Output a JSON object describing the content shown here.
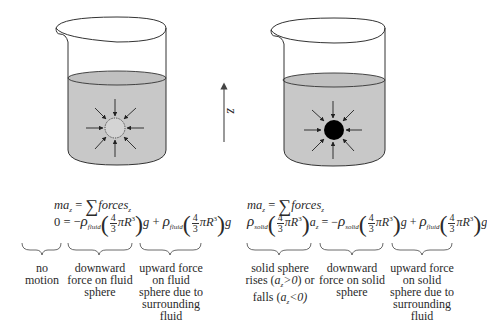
{
  "diagram": {
    "axis": {
      "label": "z",
      "direction": "up"
    },
    "colors": {
      "fluid": "#c8c8c8",
      "outline": "#333333",
      "solid_sphere": "#000000",
      "background": "#ffffff"
    },
    "left_beaker": {
      "sphere": "fluid sphere (dotted outline)",
      "equation_line1": {
        "lhs": "ma",
        "lhs_sub": "z",
        "eq": "=",
        "sum": "∑",
        "rhs": "forces",
        "rhs_sub": "z"
      },
      "equation_line2": {
        "lhs": "0",
        "term1_sign": "= −",
        "term1_rho": "ρ",
        "term1_rho_sub": "fluid",
        "frac_num": "4",
        "frac_den": "3",
        "piR": "πR",
        "exp": "3",
        "g": "g",
        "term2_sign": "+",
        "term2_rho": "ρ",
        "term2_rho_sub": "fluid"
      },
      "annotations": [
        {
          "text_lines": [
            "no",
            "motion"
          ]
        },
        {
          "text_lines": [
            "downward",
            "force on fluid",
            "sphere"
          ]
        },
        {
          "text_lines": [
            "upward force",
            "on fluid",
            "sphere due to",
            "surrounding",
            "fluid"
          ]
        }
      ]
    },
    "right_beaker": {
      "sphere": "solid sphere (filled black)",
      "equation_line1": {
        "lhs": "ma",
        "lhs_sub": "z",
        "eq": "=",
        "sum": "∑",
        "rhs": "forces",
        "rhs_sub": "z"
      },
      "equation_line2": {
        "lhs_rho": "ρ",
        "lhs_rho_sub": "solid",
        "frac_num": "4",
        "frac_den": "3",
        "piR": "πR",
        "exp": "3",
        "a": "a",
        "a_sub": "z",
        "term1_sign": "= −",
        "term1_rho": "ρ",
        "term1_rho_sub": "solid",
        "g": "g",
        "term2_sign": "+",
        "term2_rho": "ρ",
        "term2_rho_sub": "fluid"
      },
      "annotations": [
        {
          "text_lines": [
            "solid sphere",
            "rises (a_z>0) or",
            "falls (a_z<0)"
          ]
        },
        {
          "text_lines": [
            "downward",
            "force on solid",
            "sphere"
          ]
        },
        {
          "text_lines": [
            "upward force",
            "on solid",
            "sphere due to",
            "surrounding",
            "fluid"
          ]
        }
      ]
    }
  }
}
